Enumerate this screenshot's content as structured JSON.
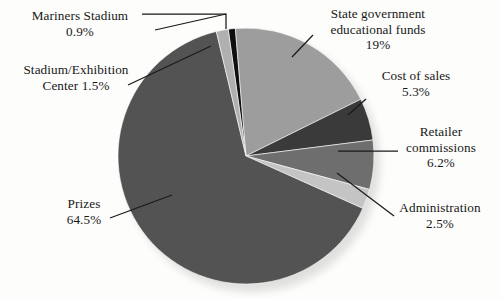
{
  "chart_data": {
    "type": "pie",
    "title": "",
    "subtitle": "",
    "xlabel": "",
    "ylabel": "",
    "legend_position": "callout-labels",
    "grid": false,
    "total_percent": 99.9,
    "start_angle_deg": -8,
    "direction": "clockwise",
    "categories": [
      "Mariners Stadium",
      "State government educational funds",
      "Cost of sales",
      "Retailer commissions",
      "Administration",
      "Prizes",
      "Stadium/Exhibition Center"
    ],
    "values": [
      0.9,
      19,
      5.3,
      6.2,
      2.5,
      64.5,
      1.5
    ],
    "slices": [
      {
        "name": "Mariners Stadium",
        "value": 0.9,
        "label": "Mariners Stadium",
        "percent_text": "0.9%",
        "color": "#100f0f"
      },
      {
        "name": "State government educational funds",
        "value": 19.0,
        "label": "State government educational funds",
        "percent_text": "19%",
        "color": "#9d9d9d"
      },
      {
        "name": "Cost of sales",
        "value": 5.3,
        "label": "Cost of sales",
        "percent_text": "5.3%",
        "color": "#3a3a3a"
      },
      {
        "name": "Retailer commissions",
        "value": 6.2,
        "label": "Retailer commissions",
        "percent_text": "6.2%",
        "color": "#6e6e6e"
      },
      {
        "name": "Administration",
        "value": 2.5,
        "label": "Administration",
        "percent_text": "2.5%",
        "color": "#c4c4c4"
      },
      {
        "name": "Prizes",
        "value": 64.5,
        "label": "Prizes",
        "percent_text": "64.5%",
        "color": "#535353"
      },
      {
        "name": "Stadium/Exhibition Center",
        "value": 1.5,
        "label": "Stadium/Exhibition Center",
        "percent_text": "1.5%",
        "color": "#b0b0b0"
      }
    ]
  },
  "labels": {
    "mariners_stadium": "Mariners Stadium\n0.9%",
    "stadium_exhibition_center": "Stadium/Exhibition\nCenter 1.5%",
    "prizes": "Prizes\n64.5%",
    "state_government": "State government\neducational funds\n19%",
    "cost_of_sales": "Cost of sales\n5.3%",
    "retailer_commissions": "Retailer\ncommissions\n6.2%",
    "administration": "Administration\n2.5%"
  },
  "colors": {
    "background": "#fdfdfc",
    "text": "#171717",
    "leader_line": "#1a1a1a",
    "mariners_stadium": "#100f0f",
    "state_government": "#9d9d9d",
    "cost_of_sales": "#3a3a3a",
    "retailer_commissions": "#6e6e6e",
    "administration": "#c4c4c4",
    "prizes": "#535353",
    "stadium_exhibition_center": "#b0b0b0"
  }
}
